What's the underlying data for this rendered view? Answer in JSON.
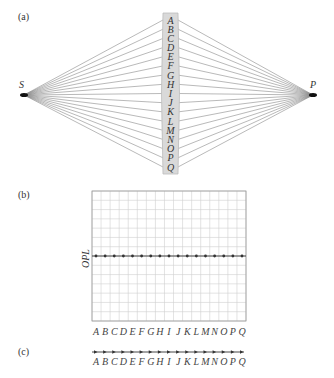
{
  "panels": {
    "a": {
      "label": "(a)",
      "source_label": "S",
      "image_label": "P",
      "lens_letters": [
        "A",
        "B",
        "C",
        "D",
        "E",
        "F",
        "G",
        "H",
        "I",
        "J",
        "K",
        "L",
        "M",
        "N",
        "O",
        "P",
        "Q"
      ]
    },
    "b": {
      "label": "(b)",
      "ylabel": "OPL",
      "xlabels": [
        "A",
        "B",
        "C",
        "D",
        "E",
        "F",
        "G",
        "H",
        "I",
        "J",
        "K",
        "L",
        "M",
        "N",
        "O",
        "P",
        "Q"
      ]
    },
    "c": {
      "label": "(c)",
      "xlabels": [
        "A",
        "B",
        "C",
        "D",
        "E",
        "F",
        "G",
        "H",
        "I",
        "J",
        "K",
        "L",
        "M",
        "N",
        "O",
        "P",
        "Q"
      ]
    }
  },
  "colors": {
    "ray": "#8a8a8a",
    "lens_fill": "#d9d9d9",
    "lens_edge": "#bdbdbd",
    "grid": "#d0d0d0",
    "frame": "#9a9a9a",
    "data": "#333333"
  },
  "chart_data": {
    "type": "scatter",
    "title": "",
    "xlabel": "",
    "ylabel": "OPL",
    "categories": [
      "A",
      "B",
      "C",
      "D",
      "E",
      "F",
      "G",
      "H",
      "I",
      "J",
      "K",
      "L",
      "M",
      "N",
      "O",
      "P",
      "Q"
    ],
    "values": [
      1,
      1,
      1,
      1,
      1,
      1,
      1,
      1,
      1,
      1,
      1,
      1,
      1,
      1,
      1,
      1,
      1
    ],
    "note": "All rays have equal optical path length (constant OPL line)",
    "grid": true
  }
}
